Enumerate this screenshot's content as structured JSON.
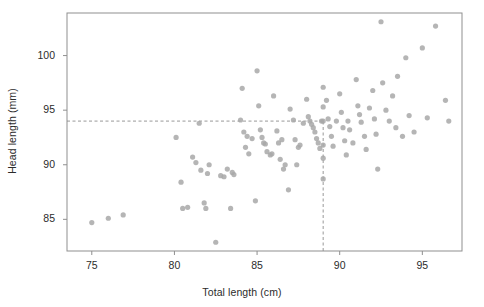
{
  "chart_data": {
    "type": "scatter",
    "title": "",
    "xlabel": "Total length (cm)",
    "ylabel": "Head length (mm)",
    "xlim": [
      73.5,
      97.4
    ],
    "ylim": [
      82.1,
      103.9
    ],
    "xticks": [
      75,
      80,
      85,
      90,
      95
    ],
    "xticklabels": [
      "75",
      "80",
      "85",
      "90",
      "95"
    ],
    "yticks": [
      85,
      90,
      95,
      100
    ],
    "yticklabels": [
      "85",
      "90",
      "95",
      "100"
    ],
    "grid": false,
    "legend": null,
    "marker": {
      "shape": "circle",
      "color": "#a8a8a8",
      "radius": 2.6,
      "opacity": 0.85
    },
    "annotations": [
      {
        "name": "horizontal-reference-line",
        "type": "hline",
        "y": 94.0,
        "style": "dashed",
        "color": "#8c8c8c",
        "x_from": 73.5,
        "x_to": 89.0
      },
      {
        "name": "vertical-reference-line",
        "type": "vline",
        "x": 89.0,
        "style": "dashed",
        "color": "#8c8c8c",
        "y_from": 82.1,
        "y_to": 94.0
      }
    ],
    "points": [
      [
        75.0,
        84.7
      ],
      [
        76.0,
        85.1
      ],
      [
        76.9,
        85.4
      ],
      [
        80.1,
        92.5
      ],
      [
        80.4,
        88.4
      ],
      [
        80.5,
        86.0
      ],
      [
        80.8,
        86.1
      ],
      [
        81.1,
        90.7
      ],
      [
        81.3,
        90.2
      ],
      [
        81.5,
        93.8
      ],
      [
        81.6,
        89.5
      ],
      [
        81.8,
        86.5
      ],
      [
        81.9,
        86.0
      ],
      [
        82.0,
        89.2
      ],
      [
        82.1,
        90.0
      ],
      [
        82.5,
        82.9
      ],
      [
        82.8,
        89.0
      ],
      [
        83.0,
        88.9
      ],
      [
        83.2,
        89.6
      ],
      [
        83.4,
        86.0
      ],
      [
        83.5,
        89.3
      ],
      [
        83.6,
        89.1
      ],
      [
        84.0,
        94.1
      ],
      [
        84.1,
        97.0
      ],
      [
        84.2,
        93.0
      ],
      [
        84.3,
        91.6
      ],
      [
        84.4,
        92.6
      ],
      [
        84.5,
        91.0
      ],
      [
        84.7,
        92.4
      ],
      [
        84.9,
        86.7
      ],
      [
        85.0,
        98.6
      ],
      [
        85.1,
        95.4
      ],
      [
        85.2,
        93.2
      ],
      [
        85.3,
        92.5
      ],
      [
        85.4,
        92.0
      ],
      [
        85.5,
        91.9
      ],
      [
        85.6,
        91.2
      ],
      [
        85.8,
        90.9
      ],
      [
        85.9,
        91.0
      ],
      [
        86.0,
        96.3
      ],
      [
        86.2,
        93.1
      ],
      [
        86.3,
        92.0
      ],
      [
        86.4,
        90.5
      ],
      [
        86.5,
        92.3
      ],
      [
        86.6,
        89.6
      ],
      [
        86.7,
        90.0
      ],
      [
        86.9,
        87.7
      ],
      [
        87.0,
        95.1
      ],
      [
        87.2,
        94.1
      ],
      [
        87.3,
        92.3
      ],
      [
        87.4,
        90.0
      ],
      [
        87.5,
        91.6
      ],
      [
        87.6,
        91.8
      ],
      [
        87.8,
        93.8
      ],
      [
        88.0,
        96.0
      ],
      [
        88.1,
        94.4
      ],
      [
        88.2,
        94.0
      ],
      [
        88.3,
        93.7
      ],
      [
        88.4,
        93.4
      ],
      [
        88.5,
        93.0
      ],
      [
        88.6,
        92.4
      ],
      [
        88.7,
        92.0
      ],
      [
        88.8,
        91.5
      ],
      [
        88.9,
        94.0
      ],
      [
        89.0,
        97.1
      ],
      [
        89.0,
        95.3
      ],
      [
        89.0,
        94.0
      ],
      [
        89.0,
        91.8
      ],
      [
        89.0,
        90.6
      ],
      [
        89.0,
        88.7
      ],
      [
        89.2,
        95.9
      ],
      [
        89.3,
        94.2
      ],
      [
        89.4,
        93.5
      ],
      [
        89.5,
        92.6
      ],
      [
        89.6,
        91.7
      ],
      [
        89.8,
        94.0
      ],
      [
        90.0,
        96.5
      ],
      [
        90.1,
        94.8
      ],
      [
        90.2,
        93.4
      ],
      [
        90.3,
        92.2
      ],
      [
        90.4,
        90.9
      ],
      [
        90.5,
        94.0
      ],
      [
        90.6,
        93.2
      ],
      [
        90.8,
        92.0
      ],
      [
        91.0,
        97.8
      ],
      [
        91.1,
        95.4
      ],
      [
        91.2,
        94.6
      ],
      [
        91.3,
        93.9
      ],
      [
        91.5,
        92.6
      ],
      [
        91.6,
        91.4
      ],
      [
        91.8,
        95.2
      ],
      [
        92.0,
        96.8
      ],
      [
        92.1,
        94.2
      ],
      [
        92.2,
        92.8
      ],
      [
        92.3,
        89.6
      ],
      [
        92.5,
        103.1
      ],
      [
        92.6,
        97.5
      ],
      [
        92.8,
        95.0
      ],
      [
        93.0,
        94.0
      ],
      [
        93.2,
        96.3
      ],
      [
        93.4,
        93.4
      ],
      [
        93.5,
        98.1
      ],
      [
        93.8,
        92.6
      ],
      [
        94.0,
        99.8
      ],
      [
        94.2,
        94.5
      ],
      [
        94.5,
        93.0
      ],
      [
        95.0,
        100.7
      ],
      [
        95.3,
        94.3
      ],
      [
        95.8,
        102.7
      ],
      [
        96.4,
        95.9
      ],
      [
        96.6,
        94.0
      ]
    ]
  },
  "axes": {
    "frame_color": "#8f8f8f",
    "tick_color": "#8f8f8f",
    "background": "#ffffff"
  }
}
